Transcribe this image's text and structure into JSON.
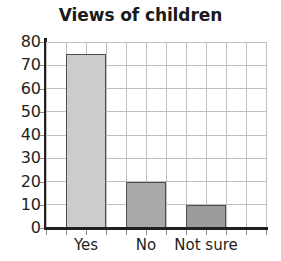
{
  "chart_data": {
    "type": "bar",
    "title": "Views of children",
    "xlabel": "",
    "ylabel": "",
    "categories": [
      "Yes",
      "No",
      "Not sure"
    ],
    "values": [
      75,
      20,
      10
    ],
    "ylim": [
      0,
      80
    ],
    "y_ticks": [
      "0",
      "10",
      "20",
      "30",
      "40",
      "50",
      "60",
      "70",
      "80"
    ],
    "y_tick_values": [
      0,
      10,
      20,
      30,
      40,
      50,
      60,
      70,
      80
    ],
    "grid": true,
    "legend": "none",
    "bar_colors": [
      "#cccccc",
      "#a9a9a9",
      "#9b9b9b"
    ],
    "bar_border_color": "#4d4d4d",
    "axis_color": "#231f20",
    "gridline_color": "#bfbfbf"
  }
}
